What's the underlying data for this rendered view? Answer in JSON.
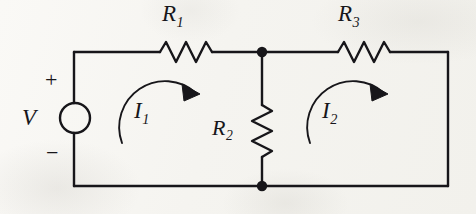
{
  "figure": {
    "type": "circuit-schematic",
    "title": "",
    "background_color": "#f7f6f3",
    "ink_color": "#17161a"
  },
  "components": {
    "voltage_source": {
      "symbol": "circle",
      "label": "V",
      "plus_sign": "+",
      "minus_sign": "−",
      "position": "left-branch",
      "cx": 75,
      "cy": 118,
      "r": 15
    },
    "resistors": [
      {
        "name": "R1",
        "label_base": "R",
        "label_sub": "1",
        "orientation": "horizontal",
        "branch": "top-left",
        "x": 160,
        "y": 52
      },
      {
        "name": "R2",
        "label_base": "R",
        "label_sub": "2",
        "orientation": "vertical",
        "branch": "middle",
        "x": 262,
        "y": 130
      },
      {
        "name": "R3",
        "label_base": "R",
        "label_sub": "3",
        "orientation": "horizontal",
        "branch": "top-right",
        "x": 338,
        "y": 52
      }
    ],
    "nodes": [
      {
        "name": "top-node",
        "x": 262,
        "y": 52,
        "filled": true
      },
      {
        "name": "bottom-node",
        "x": 262,
        "y": 186,
        "filled": true
      }
    ],
    "mesh_currents": [
      {
        "name": "I1",
        "label_base": "I",
        "label_sub": "1",
        "direction": "clockwise",
        "loop": "left-mesh",
        "arrow_cx": 168,
        "arrow_cy": 120
      },
      {
        "name": "I2",
        "label_base": "I",
        "label_sub": "2",
        "direction": "clockwise",
        "loop": "right-mesh",
        "arrow_cx": 356,
        "arrow_cy": 120
      }
    ],
    "wires": {
      "left_x": 74,
      "right_x": 448,
      "top_y": 52,
      "bottom_y": 186,
      "middle_x": 262
    }
  }
}
